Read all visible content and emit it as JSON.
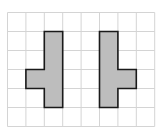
{
  "grid": {
    "cols": 8,
    "rows": 6,
    "origin_x": 7.5,
    "origin_y": 12.5,
    "cell_w": 18.4,
    "cell_h": 19,
    "line_color": "#d4d4d4",
    "background": "#ffffff"
  },
  "shapes": [
    {
      "name": "left-shape",
      "cells": [
        [
          2,
          1
        ],
        [
          2,
          2
        ],
        [
          2,
          3
        ],
        [
          2,
          4
        ],
        [
          1,
          3
        ]
      ],
      "outline": [
        [
          3,
          1
        ],
        [
          3,
          5
        ],
        [
          2,
          5
        ],
        [
          2,
          4
        ],
        [
          1,
          4
        ],
        [
          1,
          3
        ],
        [
          2,
          3
        ],
        [
          2,
          1
        ]
      ],
      "fill": "#bdbdbd",
      "stroke": "#1a1a1a"
    },
    {
      "name": "right-shape",
      "cells": [
        [
          5,
          1
        ],
        [
          5,
          2
        ],
        [
          5,
          3
        ],
        [
          5,
          4
        ],
        [
          6,
          3
        ]
      ],
      "outline": [
        [
          5,
          1
        ],
        [
          6,
          1
        ],
        [
          6,
          3
        ],
        [
          7,
          3
        ],
        [
          7,
          4
        ],
        [
          6,
          4
        ],
        [
          6,
          5
        ],
        [
          5,
          5
        ]
      ],
      "fill": "#bdbdbd",
      "stroke": "#1a1a1a"
    }
  ]
}
